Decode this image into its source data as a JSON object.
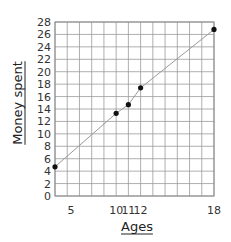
{
  "chart_data": {
    "type": "line",
    "title": "",
    "xlabel": "Ages",
    "ylabel": "Money spent",
    "xlim": [
      5,
      18
    ],
    "ylim": [
      0,
      28
    ],
    "grid": true,
    "x_grid_step": 1,
    "y_grid_step": 2,
    "x_ticks": [
      {
        "value": 5,
        "label": "5"
      },
      {
        "value": 10,
        "label": "10"
      },
      {
        "value": 11,
        "label": "11"
      },
      {
        "value": 12,
        "label": "12"
      },
      {
        "value": 18,
        "label": "18"
      }
    ],
    "y_ticks": [
      {
        "value": 0,
        "label": "0"
      },
      {
        "value": 2,
        "label": "2"
      },
      {
        "value": 4,
        "label": "4"
      },
      {
        "value": 6,
        "label": "6"
      },
      {
        "value": 8,
        "label": "8"
      },
      {
        "value": 10,
        "label": "10"
      },
      {
        "value": 12,
        "label": "12"
      },
      {
        "value": 14,
        "label": "14"
      },
      {
        "value": 16,
        "label": "16"
      },
      {
        "value": 18,
        "label": "18"
      },
      {
        "value": 20,
        "label": "20"
      },
      {
        "value": 22,
        "label": "22"
      },
      {
        "value": 24,
        "label": "24"
      },
      {
        "value": 26,
        "label": "26"
      },
      {
        "value": 28,
        "label": "28"
      }
    ],
    "series": [
      {
        "name": "Money spent",
        "x": [
          5,
          10,
          11,
          12,
          18
        ],
        "y": [
          4.7,
          13.3,
          14.7,
          17.4,
          26.8
        ]
      }
    ],
    "legend": "none"
  }
}
